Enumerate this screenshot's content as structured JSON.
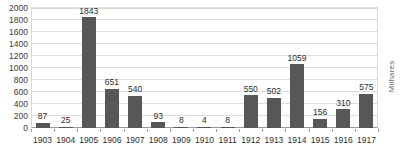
{
  "chart_data": {
    "type": "bar",
    "title": "",
    "xlabel": "",
    "ylabel": "",
    "secondary_axis_title": "Milhares",
    "ylim": [
      0,
      2000
    ],
    "ytick_step": 200,
    "yticks": [
      0,
      200,
      400,
      600,
      800,
      1000,
      1200,
      1400,
      1600,
      1800,
      2000
    ],
    "ytick_labels": [
      "0",
      "200",
      "400",
      "600",
      "800",
      "1000",
      "1200",
      "1400",
      "1600",
      "1800",
      "2000"
    ],
    "grid": true,
    "legend": false,
    "bar_color": "#575757",
    "grid_color": "#dddddd",
    "axis_color": "#9a9a9a",
    "categories": [
      "1903",
      "1904",
      "1905",
      "1906",
      "1907",
      "1908",
      "1909",
      "1910",
      "1911",
      "1912",
      "1913",
      "1914",
      "1915",
      "1916",
      "1917"
    ],
    "values": [
      87,
      25,
      1843,
      651,
      540,
      93,
      8,
      4,
      8,
      550,
      502,
      1059,
      156,
      310,
      575
    ],
    "data_labels": [
      "87",
      "25",
      "1843",
      "651",
      "540",
      "93",
      "8",
      "4",
      "8",
      "550",
      "502",
      "1059",
      "156",
      "310",
      "575"
    ]
  }
}
